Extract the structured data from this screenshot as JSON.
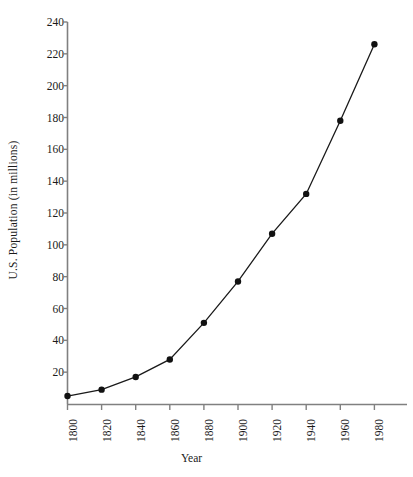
{
  "chart_data": {
    "type": "line",
    "title": "",
    "subtitle": "",
    "xlabel": "Year",
    "ylabel": "U.S. Population (in millions)",
    "x": [
      1800,
      1820,
      1840,
      1860,
      1880,
      1900,
      1920,
      1940,
      1960,
      1980
    ],
    "values": [
      5,
      9,
      17,
      28,
      51,
      77,
      107,
      132,
      178,
      226
    ],
    "series": [
      {
        "name": "U.S. Population",
        "values": [
          5,
          9,
          17,
          28,
          51,
          77,
          107,
          132,
          178,
          226
        ]
      }
    ],
    "x_tick_labels": [
      "1800",
      "1820",
      "1840",
      "1860",
      "1880",
      "1900",
      "1920",
      "1940",
      "1960",
      "1980"
    ],
    "y_tick_labels": [
      "20",
      "40",
      "60",
      "80",
      "100",
      "120",
      "140",
      "160",
      "180",
      "200",
      "220",
      "240"
    ],
    "y_ticks": [
      20,
      40,
      60,
      80,
      100,
      120,
      140,
      160,
      180,
      200,
      220,
      240
    ],
    "xlim": [
      1790,
      1995
    ],
    "ylim": [
      0,
      240
    ],
    "grid": false,
    "legend": "none",
    "marker": "filled-circle",
    "line_color": "#1a1a1a",
    "marker_color": "#111111",
    "axis_color": "#808080",
    "background_color": "#ffffff"
  }
}
